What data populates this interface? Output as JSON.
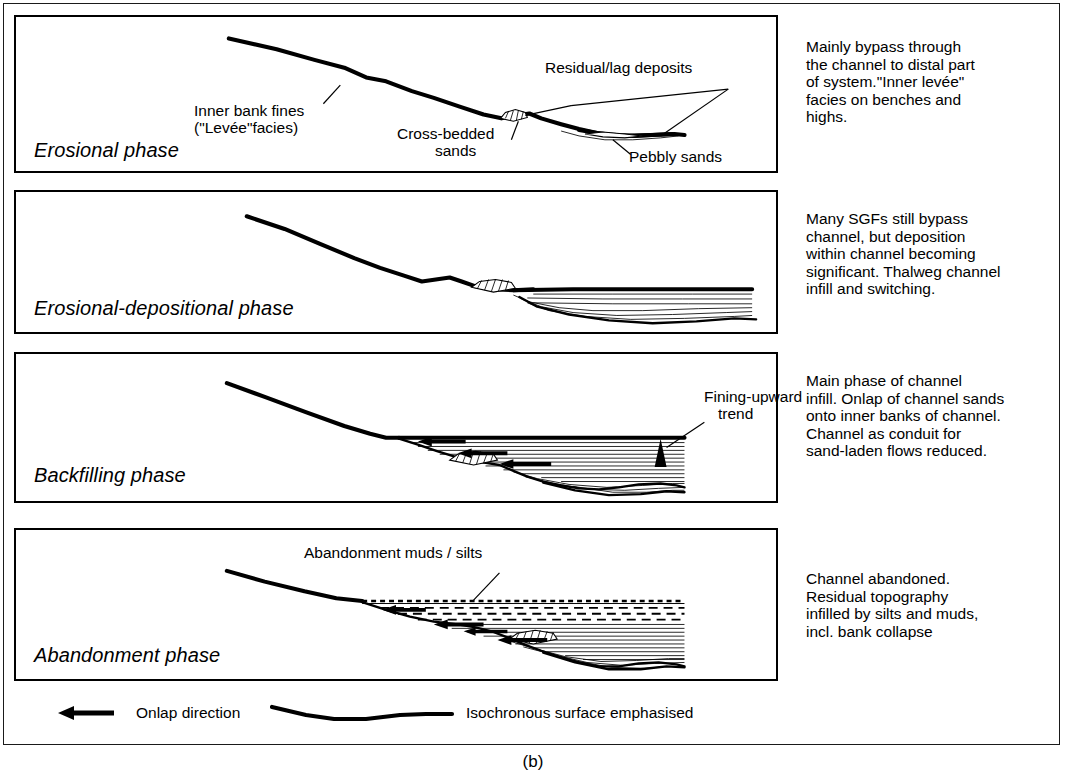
{
  "figure": {
    "caption": "(b)",
    "panels": [
      {
        "id": "erosional",
        "phase_label": "Erosional phase",
        "annotations": [
          "Inner bank fines",
          "(\"Levée\"facies)",
          "Cross-bedded",
          "sands",
          "Residual/lag deposits",
          "Pebbly sands"
        ],
        "description": "Mainly bypass through\nthe channel to distal part\nof system.\"Inner levée\"\nfacies on benches and\nhighs."
      },
      {
        "id": "erosional-depositional",
        "phase_label": "Erosional-depositional phase",
        "annotations": [],
        "description": "Many SGFs still bypass\nchannel, but deposition\nwithin channel becoming\nsignificant. Thalweg channel\ninfill and switching."
      },
      {
        "id": "backfilling",
        "phase_label": "Backfilling phase",
        "annotations": [
          "Fining-upward",
          "trend"
        ],
        "description": "Main phase of channel\ninfill. Onlap of channel sands\nonto inner banks of channel.\nChannel as conduit for\nsand-laden flows reduced."
      },
      {
        "id": "abandonment",
        "phase_label": "Abandonment phase",
        "annotations": [
          "Abandonment muds / silts"
        ],
        "description": "Channel abandoned.\nResidual topography\ninfilled by silts and muds,\nincl. bank collapse"
      }
    ],
    "legend": {
      "onlap_label": "Onlap direction",
      "isochronous_label": "Isochronous surface emphasised"
    },
    "colors": {
      "ink": "#000000",
      "background": "#ffffff",
      "frame": "#1a1a1a"
    }
  }
}
